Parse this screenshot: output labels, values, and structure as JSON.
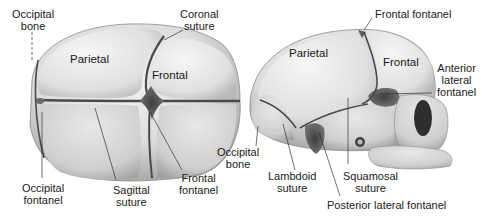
{
  "diagram": {
    "views": [
      {
        "id": "superior-view",
        "bone_labels": {
          "parietal": "Parietal",
          "frontal": "Frontal"
        },
        "callouts": {
          "occipital_bone": [
            "Occipital",
            "bone"
          ],
          "coronal_suture": [
            "Coronal",
            "suture"
          ],
          "occipital_fontanel": [
            "Occipital",
            "fontanel"
          ],
          "sagittal_suture": [
            "Sagittal",
            "suture"
          ],
          "frontal_fontanel": [
            "Frontal",
            "fontanel"
          ]
        }
      },
      {
        "id": "lateral-view",
        "bone_labels": {
          "parietal": "Parietal",
          "frontal": "Frontal"
        },
        "callouts": {
          "frontal_fontanel": "Frontal fontanel",
          "anterior_lateral_fontanel": [
            "Anterior",
            "lateral",
            "fontanel"
          ],
          "occipital_bone": [
            "Occipital",
            "bone"
          ],
          "lambdoid_suture": [
            "Lambdoid",
            "suture"
          ],
          "squamosal_suture": [
            "Squamosal",
            "suture"
          ],
          "posterior_lateral_fontanel": "Posterior lateral fontanel"
        }
      }
    ],
    "colors": {
      "bone_light": "#eeeeee",
      "bone_mid": "#d2d2d2",
      "bone_shadow": "#a8a8a8",
      "suture": "#4a4a4a",
      "fontanel": "#5a5a5a",
      "leader_line": "#333333",
      "text": "#1a1a1a"
    }
  }
}
